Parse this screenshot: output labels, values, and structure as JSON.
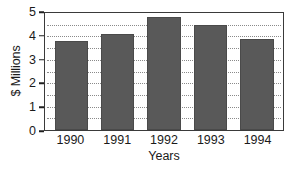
{
  "chart_data": {
    "type": "bar",
    "title": "",
    "xlabel": "Years",
    "ylabel": "$ Millions",
    "categories": [
      "1990",
      "1991",
      "1992",
      "1993",
      "1994"
    ],
    "values": [
      3.8,
      4.1,
      4.85,
      4.5,
      3.9
    ],
    "series": [
      {
        "name": "Revenue",
        "values": [
          3.8,
          4.1,
          4.85,
          4.5,
          3.9
        ]
      }
    ],
    "ylim": [
      0,
      5
    ],
    "yticks": [
      "0",
      "1",
      "2",
      "3",
      "4",
      "5"
    ],
    "ytick_values": [
      0,
      1,
      2,
      3,
      4,
      5
    ],
    "gridlines": [
      0.5,
      1.0,
      1.5,
      2.0,
      2.5,
      3.0,
      3.5,
      4.0,
      4.5
    ],
    "grid": true,
    "grid_style": "dotted",
    "legend": null,
    "legend_position": "none",
    "bar_color": "#595959",
    "grid_color": "#8a8a8a",
    "frame_color": "#3a3a3a",
    "background_color": "#ffffff"
  }
}
